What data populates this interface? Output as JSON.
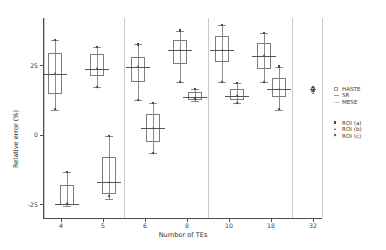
{
  "chart_data": {
    "type": "box",
    "title": "",
    "xlabel": "Number of TEs",
    "ylabel": "Relative error (%)",
    "ylim": [
      -30,
      42
    ],
    "yticks": [
      25,
      0,
      -25
    ],
    "ytick_labels": [
      "25",
      "0",
      "-25"
    ],
    "categories": [
      "4",
      "5",
      "6",
      "8",
      "10",
      "18",
      "32"
    ],
    "xtick_labels": [
      "4",
      "5",
      "6",
      "8",
      "10",
      "18",
      "32"
    ],
    "grid": false,
    "legend_position": "right",
    "legend_methods": [
      {
        "label": "HASTE",
        "key": "box-outline"
      },
      {
        "label": "SR",
        "key": "line"
      },
      {
        "label": "MESE",
        "key": "dotted-line"
      }
    ],
    "legend_rois": [
      {
        "label": "ROI (a)",
        "key": "square-marker"
      },
      {
        "label": "ROI (b)",
        "key": "triangle-marker"
      },
      {
        "label": "ROI (c)",
        "key": "diamond-marker"
      }
    ],
    "boxes": [
      {
        "category": "4",
        "series": "HASTE",
        "q1": 14.5,
        "median": 22.0,
        "q3": 29.5,
        "whisker_low": 9.0,
        "whisker_high": 34.0,
        "points": [
          {
            "value": 34.0,
            "marker": "square-marker"
          },
          {
            "value": 22.0,
            "marker": "triangle-marker"
          },
          {
            "value": 9.0,
            "marker": "diamond-marker"
          }
        ]
      },
      {
        "category": "4",
        "series": "HASTE-low",
        "q1": -25.5,
        "median": -24.8,
        "q3": -18.0,
        "whisker_low": -25.8,
        "whisker_high": -13.5,
        "points": [
          {
            "value": -13.5,
            "marker": "square-marker"
          },
          {
            "value": -24.8,
            "marker": "triangle-marker"
          },
          {
            "value": -25.0,
            "marker": "diamond-marker"
          }
        ]
      },
      {
        "category": "5",
        "series": "HASTE",
        "q1": 21.0,
        "median": 23.8,
        "q3": 29.0,
        "whisker_low": 17.0,
        "whisker_high": 31.5,
        "points": [
          {
            "value": 31.5,
            "marker": "square-marker"
          },
          {
            "value": 23.8,
            "marker": "triangle-marker"
          },
          {
            "value": 17.0,
            "marker": "diamond-marker"
          }
        ]
      },
      {
        "category": "5",
        "series": "HASTE-low",
        "q1": -21.5,
        "median": -17.0,
        "q3": -8.0,
        "whisker_low": -23.0,
        "whisker_high": -0.5,
        "points": [
          {
            "value": -0.5,
            "marker": "square-marker"
          },
          {
            "value": -17.0,
            "marker": "triangle-marker"
          },
          {
            "value": -22.0,
            "marker": "diamond-marker"
          }
        ]
      },
      {
        "category": "6",
        "series": "HASTE",
        "q1": 19.0,
        "median": 24.5,
        "q3": 28.0,
        "whisker_low": 12.5,
        "whisker_high": 32.5,
        "points": [
          {
            "value": 32.5,
            "marker": "square-marker"
          },
          {
            "value": 24.5,
            "marker": "triangle-marker"
          },
          {
            "value": 12.5,
            "marker": "diamond-marker"
          }
        ]
      },
      {
        "category": "6",
        "series": "SR",
        "q1": -2.5,
        "median": 2.5,
        "q3": 7.5,
        "whisker_low": -6.5,
        "whisker_high": 11.5,
        "points": [
          {
            "value": 11.5,
            "marker": "square-marker"
          },
          {
            "value": 2.5,
            "marker": "triangle-marker"
          },
          {
            "value": -6.5,
            "marker": "diamond-marker"
          }
        ]
      },
      {
        "category": "8",
        "series": "HASTE",
        "q1": 25.5,
        "median": 30.5,
        "q3": 34.0,
        "whisker_low": 19.0,
        "whisker_high": 37.5,
        "points": [
          {
            "value": 37.5,
            "marker": "square-marker"
          },
          {
            "value": 30.5,
            "marker": "triangle-marker"
          },
          {
            "value": 19.0,
            "marker": "diamond-marker"
          }
        ]
      },
      {
        "category": "8",
        "series": "SR",
        "q1": 12.5,
        "median": 13.5,
        "q3": 15.5,
        "whisker_low": 12.0,
        "whisker_high": 16.5,
        "points": [
          {
            "value": 16.5,
            "marker": "square-marker"
          },
          {
            "value": 13.3,
            "marker": "triangle-marker"
          },
          {
            "value": 12.8,
            "marker": "diamond-marker"
          }
        ]
      },
      {
        "category": "10",
        "series": "HASTE",
        "q1": 26.0,
        "median": 30.5,
        "q3": 35.5,
        "whisker_low": 19.0,
        "whisker_high": 39.5,
        "points": [
          {
            "value": 39.5,
            "marker": "square-marker"
          },
          {
            "value": 30.5,
            "marker": "triangle-marker"
          },
          {
            "value": 19.0,
            "marker": "diamond-marker"
          }
        ]
      },
      {
        "category": "10",
        "series": "SR",
        "q1": 12.5,
        "median": 14.0,
        "q3": 16.5,
        "whisker_low": 11.5,
        "whisker_high": 18.5,
        "points": [
          {
            "value": 18.5,
            "marker": "square-marker"
          },
          {
            "value": 14.2,
            "marker": "triangle-marker"
          },
          {
            "value": 11.5,
            "marker": "diamond-marker"
          }
        ]
      },
      {
        "category": "18",
        "series": "HASTE",
        "q1": 23.5,
        "median": 28.5,
        "q3": 33.0,
        "whisker_low": 19.0,
        "whisker_high": 36.5,
        "points": [
          {
            "value": 36.5,
            "marker": "square-marker"
          },
          {
            "value": 28.5,
            "marker": "triangle-marker"
          },
          {
            "value": 19.0,
            "marker": "diamond-marker"
          }
        ]
      },
      {
        "category": "18",
        "series": "MESE",
        "q1": 13.5,
        "median": 16.5,
        "q3": 20.5,
        "whisker_low": 9.0,
        "whisker_high": 24.5,
        "points": [
          {
            "value": 24.5,
            "marker": "square-marker"
          },
          {
            "value": 16.5,
            "marker": "triangle-marker"
          },
          {
            "value": 9.0,
            "marker": "diamond-marker"
          }
        ]
      },
      {
        "category": "32",
        "series": "MESE",
        "q1": 15.5,
        "median": 16.3,
        "q3": 17.2,
        "whisker_low": 15.0,
        "whisker_high": 17.6,
        "points": [
          {
            "value": 17.2,
            "marker": "square-marker"
          },
          {
            "value": 16.3,
            "marker": "triangle-marker"
          },
          {
            "value": 15.8,
            "marker": "diamond-marker"
          }
        ]
      }
    ]
  }
}
